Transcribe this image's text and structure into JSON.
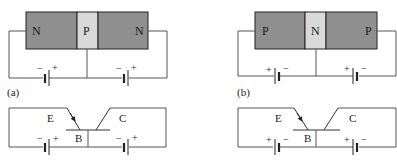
{
  "colors": {
    "dark_region": "#8f8f8f",
    "light_region": "#d9d9d9",
    "border": "#222222",
    "wire": "#555555",
    "background": "#ffffff"
  },
  "panel_a": {
    "caption": "(a)",
    "structure": {
      "regions": [
        {
          "label": "N",
          "type": "dark"
        },
        {
          "label": "P",
          "type": "light"
        },
        {
          "label": "N",
          "type": "dark"
        }
      ],
      "battery_left": {
        "neg": "−",
        "pos": "+"
      },
      "battery_right": {
        "neg": "−",
        "pos": "+"
      }
    },
    "symbol": {
      "emitter": "E",
      "base": "B",
      "collector": "C",
      "battery_left": {
        "neg": "−",
        "pos": "+"
      },
      "battery_right": {
        "neg": "−",
        "pos": "+"
      }
    }
  },
  "panel_b": {
    "caption": "(b)",
    "structure": {
      "regions": [
        {
          "label": "P",
          "type": "dark"
        },
        {
          "label": "N",
          "type": "light"
        },
        {
          "label": "P",
          "type": "dark"
        }
      ],
      "battery_left": {
        "pos": "+",
        "neg": "−"
      },
      "battery_right": {
        "pos": "+",
        "neg": "−"
      }
    },
    "symbol": {
      "emitter": "E",
      "base": "B",
      "collector": "C",
      "battery_left": {
        "pos": "+",
        "neg": "−"
      },
      "battery_right": {
        "pos": "+",
        "neg": "−"
      }
    }
  }
}
